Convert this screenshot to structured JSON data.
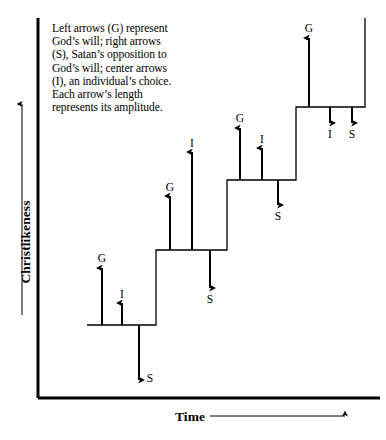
{
  "figure": {
    "caption": "Left arrows (G) represent God’s will; right arrows (S), Satan’s opposition to God’s will; center arrows (I), an individual’s choice. Each arrow’s length represents its amplitude.",
    "axis_y_label": "Christlikeness",
    "axis_x_label": "Time",
    "stroke_color": "#000000",
    "background_color": "#ffffff"
  },
  "chart_data": {
    "type": "line",
    "title": "",
    "xlabel": "Time",
    "ylabel": "Christlikeness",
    "grid": false,
    "legend": "none",
    "steps": [
      {
        "index": 1,
        "level": 1,
        "x_start": 87,
        "x_end": 156,
        "top_y": 325
      },
      {
        "index": 2,
        "level": 2,
        "x_start": 156,
        "x_end": 227,
        "top_y": 250
      },
      {
        "index": 3,
        "level": 3,
        "x_start": 227,
        "x_end": 296,
        "top_y": 180
      },
      {
        "index": 4,
        "level": 4,
        "x_start": 296,
        "x_end": 365,
        "top_y": 107
      }
    ],
    "categories": [
      "step 1",
      "step 2",
      "step 3",
      "step 4"
    ],
    "values": [
      1,
      2,
      3,
      4
    ],
    "arrows": [
      {
        "label": "G",
        "step": 1,
        "direction": "up",
        "x": 102,
        "base_y": 325,
        "tip_y": 268,
        "amplitude": 57
      },
      {
        "label": "I",
        "step": 1,
        "direction": "up",
        "x": 122,
        "base_y": 325,
        "tip_y": 303,
        "amplitude": 22
      },
      {
        "label": "S",
        "step": 1,
        "direction": "down",
        "x": 139,
        "base_y": 325,
        "tip_y": 380,
        "amplitude": 55
      },
      {
        "label": "G",
        "step": 2,
        "direction": "up",
        "x": 170,
        "base_y": 250,
        "tip_y": 196,
        "amplitude": 54
      },
      {
        "label": "I",
        "step": 2,
        "direction": "up",
        "x": 192,
        "base_y": 250,
        "tip_y": 152,
        "amplitude": 98
      },
      {
        "label": "S",
        "step": 2,
        "direction": "down",
        "x": 210,
        "base_y": 250,
        "tip_y": 288,
        "amplitude": 38
      },
      {
        "label": "G",
        "step": 3,
        "direction": "up",
        "x": 240,
        "base_y": 180,
        "tip_y": 128,
        "amplitude": 52
      },
      {
        "label": "I",
        "step": 3,
        "direction": "up",
        "x": 262,
        "base_y": 180,
        "tip_y": 148,
        "amplitude": 32
      },
      {
        "label": "S",
        "step": 3,
        "direction": "down",
        "x": 278,
        "base_y": 180,
        "tip_y": 205,
        "amplitude": 25
      },
      {
        "label": "G",
        "step": 4,
        "direction": "up",
        "x": 309,
        "base_y": 107,
        "tip_y": 38,
        "amplitude": 69
      },
      {
        "label": "I",
        "step": 4,
        "direction": "down",
        "x": 330,
        "base_y": 107,
        "tip_y": 123,
        "amplitude": 16
      },
      {
        "label": "S",
        "step": 4,
        "direction": "down",
        "x": 352,
        "base_y": 107,
        "tip_y": 123,
        "amplitude": 16
      }
    ],
    "arrow_labels": [
      {
        "text": "G",
        "x": 102,
        "y": 252
      },
      {
        "text": "I",
        "x": 122,
        "y": 288
      },
      {
        "text": "S",
        "x": 150,
        "y": 372
      },
      {
        "text": "G",
        "x": 170,
        "y": 181
      },
      {
        "text": "I",
        "x": 192,
        "y": 137
      },
      {
        "text": "S",
        "x": 210,
        "y": 293
      },
      {
        "text": "G",
        "x": 240,
        "y": 112
      },
      {
        "text": "I",
        "x": 262,
        "y": 133
      },
      {
        "text": "S",
        "x": 278,
        "y": 210
      },
      {
        "text": "G",
        "x": 309,
        "y": 22
      },
      {
        "text": "I",
        "x": 330,
        "y": 128
      },
      {
        "text": "S",
        "x": 352,
        "y": 128
      }
    ],
    "axes": {
      "origin_x": 38,
      "origin_y": 398,
      "y_axis_top": 18,
      "x_axis_right": 380,
      "y_direction_arrow": {
        "x": 22,
        "from_y": 315,
        "to_y": 104
      },
      "x_direction_arrow": {
        "y": 416,
        "from_x": 210,
        "to_x": 345
      }
    }
  }
}
